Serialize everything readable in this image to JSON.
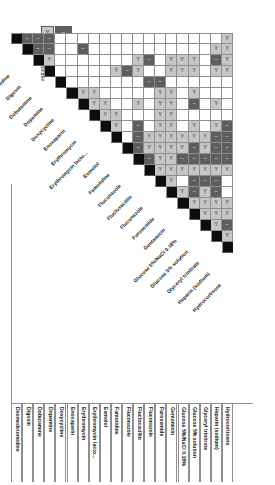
{
  "figure": {
    "kind": "compatibility-matrix",
    "orientation": "rotated-90",
    "glyphs": {
      "compatible": "Y",
      "incompatible": "–",
      "unknown": ""
    }
  },
  "legend": {
    "swatch_compatible_glyph": "Y",
    "swatch_incompatible_glyph": "–",
    "swatch_blank_glyph": "",
    "labels": [
      "Y site compatible",
      "incompatible",
      "No information"
    ],
    "colors": {
      "compatible": "#c6c6c6",
      "incompatible": "#5e5e5e",
      "unknown": "#ffffff",
      "self": "#0d0d0d",
      "grid": "#8e8e8e"
    }
  },
  "chart_data": {
    "type": "heatmap",
    "title": "",
    "xlabel": "",
    "ylabel": "",
    "grid": true,
    "legend_position": "top-left",
    "categories": [
      "Dexmedetomidine",
      "Digoxin",
      "Dobutamine",
      "Dopamine",
      "Doxycycline",
      "Enoxaparin",
      "Erythromycin",
      "Erythromycin lacto...",
      "Esmolol",
      "Famotidine",
      "Fluconazole",
      "Flucloxacillin",
      "Fluconazole",
      "Furosemide",
      "Gentamicin",
      "Glucose 5%/NaCl 0.18%",
      "Glucose 5% solution",
      "Glyceryl trinitrate",
      "Heparin (sodium)",
      "Hydrocortisone"
    ],
    "row_labels": [
      "Dexmedetomidine",
      "Digoxin",
      "Dobutamine",
      "Dopamine",
      "Doxycycline",
      "Enoxaparin",
      "Erythromycin",
      "Erythromycin lacto...",
      "Esmolol",
      "Famotidine",
      "Fluconazole",
      "Flucloxacillin",
      "Fluconazole",
      "Furosemide",
      "Gentamicin",
      "Glucose 5%/NaCl 0.18%",
      "Glucose 5% solution",
      "Glyceryl trinitrate",
      "Heparin (sodium)",
      "Hydrocortisone"
    ],
    "column_labels": [
      "Dexmedetomidine",
      "Digoxin",
      "Dobutamine",
      "Dopamine",
      "Doxycycline",
      "Enoxaparin",
      "Erythromycin",
      "Erythromycin lacto...",
      "Esmolol",
      "Famotidine",
      "Fluconazole",
      "Flucloxacillin",
      "Fluconazole",
      "Furosemide",
      "Gentamicin",
      "Glucose 5%/NaCl 0.18%",
      "Glucose 5% solution",
      "Glyceryl trinitrate",
      "Heparin (sodium)",
      "Hydrocortisone"
    ],
    "value_scale": {
      "d": "self / diagonal (black)",
      "y": "Y site compatible (light grey, Y)",
      "n": "incompatible (dark grey, dash)",
      "u": "No information (white / blank)"
    },
    "matrix": [
      [
        "d",
        "n",
        "n",
        "n",
        "u",
        "u",
        "u",
        "u",
        "u",
        "u",
        "u",
        "u",
        "u",
        "u",
        "u",
        "u",
        "u",
        "u",
        "u",
        "y"
      ],
      [
        "u",
        "d",
        "n",
        "n",
        "u",
        "u",
        "n",
        "u",
        "u",
        "u",
        "u",
        "u",
        "u",
        "u",
        "u",
        "u",
        "u",
        "u",
        "y",
        "y"
      ],
      [
        "u",
        "u",
        "d",
        "y",
        "u",
        "u",
        "u",
        "u",
        "u",
        "u",
        "u",
        "y",
        "n",
        "u",
        "y",
        "y",
        "y",
        "u",
        "n",
        "y"
      ],
      [
        "u",
        "u",
        "u",
        "d",
        "u",
        "u",
        "u",
        "u",
        "u",
        "y",
        "n",
        "y",
        "u",
        "u",
        "y",
        "y",
        "y",
        "u",
        "y",
        "y"
      ],
      [
        "u",
        "u",
        "u",
        "u",
        "d",
        "u",
        "u",
        "u",
        "u",
        "u",
        "u",
        "u",
        "n",
        "n",
        "u",
        "u",
        "u",
        "u",
        "u",
        "u"
      ],
      [
        "u",
        "u",
        "u",
        "u",
        "u",
        "d",
        "y",
        "y",
        "u",
        "u",
        "u",
        "u",
        "u",
        "y",
        "y",
        "u",
        "y",
        "u",
        "u",
        "u"
      ],
      [
        "u",
        "u",
        "u",
        "u",
        "u",
        "u",
        "d",
        "y",
        "y",
        "u",
        "u",
        "y",
        "u",
        "y",
        "y",
        "u",
        "n",
        "u",
        "y",
        "u"
      ],
      [
        "u",
        "u",
        "u",
        "u",
        "u",
        "u",
        "u",
        "d",
        "y",
        "y",
        "u",
        "u",
        "u",
        "y",
        "y",
        "u",
        "u",
        "u",
        "u",
        "u"
      ],
      [
        "u",
        "u",
        "u",
        "u",
        "u",
        "u",
        "y",
        "y",
        "d",
        "y",
        "u",
        "n",
        "u",
        "y",
        "y",
        "u",
        "y",
        "u",
        "y",
        "n"
      ],
      [
        "u",
        "y",
        "y",
        "y",
        "u",
        "u",
        "u",
        "y",
        "u",
        "d",
        "u",
        "n",
        "y",
        "y",
        "y",
        "y",
        "y",
        "y",
        "n",
        "n"
      ],
      [
        "u",
        "u",
        "u",
        "u",
        "u",
        "u",
        "u",
        "u",
        "u",
        "u",
        "d",
        "n",
        "y",
        "y",
        "y",
        "y",
        "n",
        "y",
        "n",
        "n"
      ],
      [
        "u",
        "n",
        "n",
        "n",
        "u",
        "u",
        "u",
        "u",
        "u",
        "y",
        "n",
        "d",
        "n",
        "y",
        "y",
        "n",
        "n",
        "n",
        "n",
        "n"
      ],
      [
        "y",
        "y",
        "y",
        "y",
        "u",
        "u",
        "u",
        "n",
        "y",
        "y",
        "y",
        "y",
        "d",
        "y",
        "y",
        "y",
        "y",
        "y",
        "y",
        "y"
      ],
      [
        "u",
        "n",
        "y",
        "n",
        "n",
        "u",
        "y",
        "y",
        "y",
        "u",
        "u",
        "u",
        "u",
        "d",
        "y",
        "u",
        "n",
        "n",
        "n",
        "u"
      ],
      [
        "u",
        "u",
        "n",
        "n",
        "u",
        "u",
        "u",
        "u",
        "u",
        "u",
        "u",
        "u",
        "u",
        "u",
        "d",
        "y",
        "n",
        "y",
        "n",
        "u"
      ],
      [
        "u",
        "u",
        "y",
        "y",
        "u",
        "u",
        "y",
        "y",
        "u",
        "y",
        "y",
        "y",
        "u",
        "y",
        "y",
        "d",
        "y",
        "y",
        "y",
        "y"
      ],
      [
        "y",
        "y",
        "y",
        "y",
        "y",
        "n",
        "u",
        "y",
        "y",
        "y",
        "y",
        "u",
        "u",
        "y",
        "y",
        "u",
        "d",
        "y",
        "y",
        "y"
      ],
      [
        "u",
        "u",
        "n",
        "n",
        "u",
        "u",
        "u",
        "y",
        "u",
        "y",
        "y",
        "u",
        "u",
        "u",
        "u",
        "u",
        "u",
        "d",
        "y",
        "n"
      ],
      [
        "u",
        "y",
        "y",
        "y",
        "u",
        "u",
        "u",
        "u",
        "u",
        "y",
        "y",
        "u",
        "u",
        "y",
        "y",
        "y",
        "n",
        "u",
        "d",
        "y"
      ],
      [
        "u",
        "u",
        "u",
        "u",
        "u",
        "u",
        "u",
        "u",
        "u",
        "u",
        "u",
        "u",
        "u",
        "u",
        "u",
        "u",
        "u",
        "u",
        "u",
        "d"
      ]
    ]
  }
}
